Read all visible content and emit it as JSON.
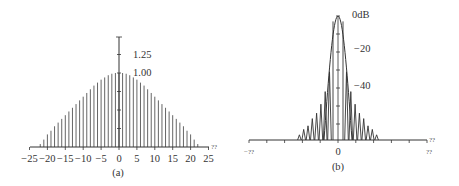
{
  "chart_data": [
    {
      "id": "a",
      "type": "bar",
      "style": "stem",
      "caption": "(a)",
      "xlabel": "??",
      "ylabel": "",
      "xlim": [
        -25,
        25
      ],
      "ylim": [
        0,
        1.4
      ],
      "x_ticks": [
        -25,
        -20,
        -15,
        -10,
        -5,
        0,
        5,
        10,
        15,
        20,
        25
      ],
      "x_tick_labels": [
        "−25",
        "−20",
        "−15",
        "−10",
        "−5",
        "0",
        "5",
        "10",
        "15",
        "20",
        "25"
      ],
      "y_tick_labels": [
        {
          "value": 1.25,
          "label": "1.25"
        },
        {
          "value": 1.0,
          "label": "1.00"
        }
      ],
      "y_minor_ticks": [
        0.25,
        0.5,
        0.75,
        1.0,
        1.25
      ],
      "x": [
        -22,
        -21,
        -20,
        -19,
        -18,
        -17,
        -16,
        -15,
        -14,
        -13,
        -12,
        -11,
        -10,
        -9,
        -8,
        -7,
        -6,
        -5,
        -4,
        -3,
        -2,
        -1,
        0,
        1,
        2,
        3,
        4,
        5,
        6,
        7,
        8,
        9,
        10,
        11,
        12,
        13,
        14,
        15,
        16,
        17,
        18,
        19,
        20,
        21,
        22
      ],
      "values": [
        0.04,
        0.1,
        0.17,
        0.22,
        0.28,
        0.33,
        0.38,
        0.43,
        0.48,
        0.53,
        0.58,
        0.63,
        0.68,
        0.73,
        0.78,
        0.83,
        0.87,
        0.91,
        0.94,
        0.97,
        0.99,
        1.0,
        1.0,
        1.0,
        0.99,
        0.97,
        0.94,
        0.91,
        0.87,
        0.83,
        0.78,
        0.73,
        0.68,
        0.63,
        0.58,
        0.53,
        0.48,
        0.43,
        0.38,
        0.33,
        0.28,
        0.22,
        0.17,
        0.1,
        0.04
      ],
      "grid": false
    },
    {
      "id": "b",
      "type": "line",
      "caption": "(b)",
      "xlabel": "??",
      "ylabel": "dB",
      "x_tick_labels": [
        "−??",
        "0",
        "??"
      ],
      "y_tick_labels": [
        {
          "value": 0,
          "label": "0dB"
        },
        {
          "value": -20,
          "label": "−20"
        },
        {
          "value": -40,
          "label": "−40"
        }
      ],
      "ylim": [
        -69,
        0
      ],
      "mainlobe_peak_db": 0,
      "sidelobe_peaks_db": [
        -31,
        -42,
        -49,
        -54,
        -57,
        -61,
        -63,
        -66
      ],
      "series": [
        {
          "name": "envelope (main lobe outline)",
          "values_db": [
            0
          ]
        },
        {
          "name": "window spectrum",
          "values_db": [
            0,
            -31,
            -42,
            -49,
            -54,
            -57,
            -61,
            -63,
            -66
          ]
        }
      ],
      "grid": false
    }
  ],
  "labels": {
    "a_caption": "(a)",
    "b_caption": "(b)",
    "a_xaxis_end": "??",
    "a_y_125": "1.25",
    "a_y_100": "1.00",
    "b_y_0": "0dB",
    "b_y_20": "−20",
    "b_y_40": "−40",
    "b_x_left": "−??",
    "b_x_center": "0",
    "b_x_right": "??",
    "b_xaxis_end": "??"
  }
}
